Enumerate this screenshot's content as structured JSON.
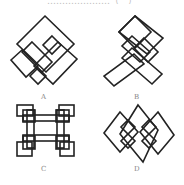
{
  "question": {
    "title_fragment": "…………………（　）"
  },
  "options": [
    {
      "key": "A",
      "label": "A",
      "figure": "figure-a-rotated-interlocking-rectangles"
    },
    {
      "key": "B",
      "label": "B",
      "figure": "figure-b-diamond-with-crossed-bars"
    },
    {
      "key": "C",
      "label": "C",
      "figure": "figure-c-square-lattice-knot"
    },
    {
      "key": "D",
      "label": "D",
      "figure": "figure-d-three-interlaced-diamonds"
    }
  ],
  "style": {
    "stroke_color": "#222222",
    "label_color": "#888888",
    "background": "#ffffff"
  }
}
